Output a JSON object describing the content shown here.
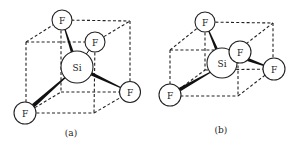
{
  "figure": {
    "width": 297,
    "height": 148,
    "colors": {
      "ink": "#222222",
      "background": "#ffffff"
    },
    "panels": [
      {
        "id": "a",
        "label": "(a)",
        "label_pos": [
          71,
          133
        ],
        "cube_edges": [
          [
            [
              26,
              42
            ],
            [
              95,
              42
            ]
          ],
          [
            [
              26,
              42
            ],
            [
              61,
              20
            ]
          ],
          [
            [
              61,
              20
            ],
            [
              130,
              21
            ]
          ],
          [
            [
              95,
              42
            ],
            [
              130,
              21
            ]
          ],
          [
            [
              26,
              42
            ],
            [
              26,
              113
            ]
          ],
          [
            [
              95,
              42
            ],
            [
              94,
              113
            ]
          ],
          [
            [
              130,
              21
            ],
            [
              130,
              92
            ]
          ],
          [
            [
              61,
              20
            ],
            [
              61,
              92
            ]
          ],
          [
            [
              26,
              113
            ],
            [
              94,
              113
            ]
          ],
          [
            [
              61,
              92
            ],
            [
              130,
              92
            ]
          ],
          [
            [
              26,
              113
            ],
            [
              61,
              92
            ]
          ],
          [
            [
              94,
              113
            ],
            [
              130,
              92
            ]
          ]
        ],
        "wedge_bonds": [
          {
            "from": [
              62,
              20
            ],
            "to": [
              77,
              67
            ],
            "w0": 0.6,
            "w1": 4
          },
          {
            "from": [
              130,
              92
            ],
            "to": [
              77,
              67
            ],
            "w0": 0.6,
            "w1": 4.5
          },
          {
            "from": [
              25,
              113
            ],
            "to": [
              77,
              67
            ],
            "w0": 4.5,
            "w1": 0.6
          }
        ],
        "line_bonds": [
          {
            "from": [
              95,
              42
            ],
            "to": [
              77,
              67
            ]
          }
        ],
        "atoms": [
          {
            "symbol": "F",
            "x": 62,
            "y": 20,
            "r": 10
          },
          {
            "symbol": "Si",
            "x": 77,
            "y": 67,
            "r": 16
          },
          {
            "symbol": "F",
            "x": 95,
            "y": 42,
            "r": 10
          },
          {
            "symbol": "F",
            "x": 130,
            "y": 92,
            "r": 10.5
          },
          {
            "symbol": "F",
            "x": 25,
            "y": 113,
            "r": 11
          }
        ]
      },
      {
        "id": "b",
        "label": "(b)",
        "label_pos": [
          221,
          130
        ],
        "cube_edges": [
          [
            [
              170,
              50
            ],
            [
              238,
              50
            ]
          ],
          [
            [
              170,
              50
            ],
            [
              205,
              22
            ]
          ],
          [
            [
              205,
              22
            ],
            [
              273,
              23
            ]
          ],
          [
            [
              238,
              50
            ],
            [
              273,
              23
            ]
          ],
          [
            [
              170,
              50
            ],
            [
              170,
              96
            ]
          ],
          [
            [
              238,
              50
            ],
            [
              238,
              96
            ]
          ],
          [
            [
              273,
              23
            ],
            [
              273,
              69
            ]
          ],
          [
            [
              205,
              22
            ],
            [
              205,
              70
            ]
          ],
          [
            [
              170,
              96
            ],
            [
              238,
              96
            ]
          ],
          [
            [
              205,
              70
            ],
            [
              273,
              69
            ]
          ],
          [
            [
              170,
              96
            ],
            [
              205,
              70
            ]
          ],
          [
            [
              238,
              96
            ],
            [
              273,
              69
            ]
          ]
        ],
        "wedge_bonds": [
          {
            "from": [
              205,
              22
            ],
            "to": [
              222,
              62
            ],
            "w0": 0.6,
            "w1": 4
          },
          {
            "from": [
              274,
              69
            ],
            "to": [
              238,
              56
            ],
            "w0": 0.6,
            "w1": 4.5
          },
          {
            "from": [
              170,
              95
            ],
            "to": [
              218,
              68
            ],
            "w0": 4.5,
            "w1": 0.6
          }
        ],
        "line_bonds": [],
        "atoms": [
          {
            "symbol": "F",
            "x": 205,
            "y": 22,
            "r": 10
          },
          {
            "symbol": "Si",
            "x": 222,
            "y": 63,
            "r": 15
          },
          {
            "symbol": "F",
            "x": 240,
            "y": 52,
            "r": 11
          },
          {
            "symbol": "F",
            "x": 274,
            "y": 69,
            "r": 11
          },
          {
            "symbol": "F",
            "x": 170,
            "y": 95,
            "r": 11
          }
        ]
      }
    ]
  }
}
